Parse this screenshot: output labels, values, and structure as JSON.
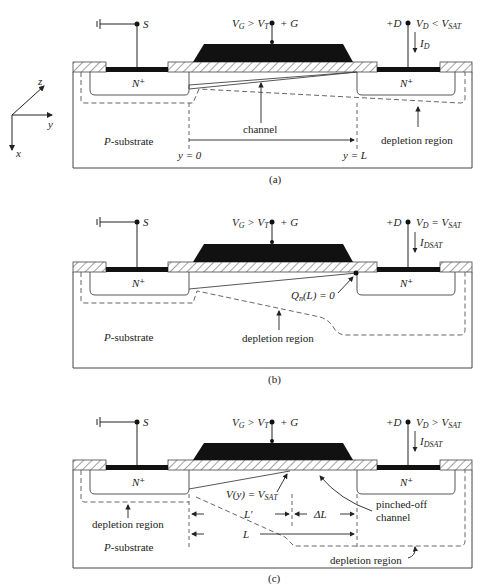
{
  "axes": {
    "z": "z",
    "y": "y",
    "x": "x"
  },
  "panels": [
    {
      "id": "a",
      "caption": "(a)",
      "source_label": "S",
      "gate_label": "+ G",
      "gate_condition": "V_G > V_T",
      "drain_label": "+D",
      "drain_condition": "V_D < V_SAT",
      "current_label": "I_D",
      "nplus_left": "N+",
      "nplus_right": "N+",
      "substrate": "P-substrate",
      "channel_label": "channel",
      "depletion_label": "depletion region",
      "y0_label": "y = 0",
      "yL_label": "y = L"
    },
    {
      "id": "b",
      "caption": "(b)",
      "source_label": "S",
      "gate_label": "+ G",
      "gate_condition": "V_G > V_T",
      "drain_label": "+D",
      "drain_condition": "V_D = V_SAT",
      "current_label": "I_DSAT",
      "nplus_left": "N+",
      "nplus_right": "N+",
      "substrate": "P-substrate",
      "pinch_label": "Q_n(L) = 0",
      "depletion_label": "depletion region"
    },
    {
      "id": "c",
      "caption": "(c)",
      "source_label": "S",
      "gate_label": "+ G",
      "gate_condition": "V_G > V_T",
      "drain_label": "+D",
      "drain_condition": "V_D > V_SAT",
      "current_label": "I_DSAT",
      "nplus_left": "N+",
      "nplus_right": "N+",
      "substrate": "P-substrate",
      "vsat_label": "V(y) = V_SAT",
      "pinched_label_1": "pinched-off",
      "pinched_label_2": "channel",
      "depletion_left_label": "depletion region",
      "depletion_right_label": "depletion region",
      "Lprime_label": "L'",
      "deltaL_label": "ΔL",
      "L_label": "L"
    }
  ]
}
